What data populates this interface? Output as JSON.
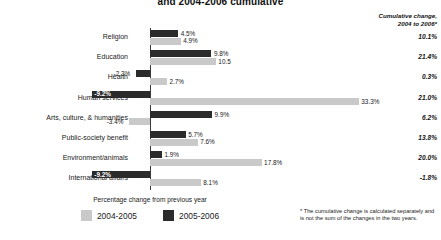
{
  "chart_data": {
    "type": "bar",
    "title": "and 2004-2006 cumulative",
    "orientation": "horizontal",
    "xlabel": "Percentage change from previous year",
    "ylabel": "",
    "grid": false,
    "zero_line": true,
    "xlim": [
      -12,
      36
    ],
    "legend_position": "bottom-center",
    "categories": [
      "Religion",
      "Education",
      "Health",
      "Human services",
      "Arts, culture, & humanities",
      "Public-society benefit",
      "Environment/animals",
      "International affairs"
    ],
    "series": [
      {
        "name": "2005-2006",
        "color": "#2b2b2b",
        "values": [
          4.5,
          9.8,
          -2.3,
          -9.2,
          9.9,
          5.7,
          1.9,
          -9.2
        ],
        "labels": [
          "4.5%",
          "9.8%",
          "-2.3%",
          "-9.2%",
          "9.9%",
          "5.7%",
          "1.9%",
          "-9.2%"
        ]
      },
      {
        "name": "2004-2005",
        "color": "#c9c9c9",
        "values": [
          4.9,
          10.5,
          2.7,
          33.3,
          -3.4,
          7.6,
          17.8,
          8.1
        ],
        "labels": [
          "4.9%",
          "10.5",
          "2.7%",
          "33.3%",
          "-3.4%",
          "7.6%",
          "17.8%",
          "8.1%"
        ]
      }
    ],
    "cumulative_header": "Cumulative change,\n2004 to 2006*",
    "cumulative_header_line1": "Cumulative change,",
    "cumulative_header_line2": "2004 to 2006*",
    "cumulative_values": [
      "10.1%",
      "21.4%",
      "0.3%",
      "21.0%",
      "6.2%",
      "13.8%",
      "20.0%",
      "-1.8%"
    ],
    "annotations": [
      "* The cumulative change is calculated separately and is not the sum of the changes in the two years."
    ]
  },
  "legend": {
    "caption": "Percentage change from previous year",
    "items": [
      {
        "label": "2004-2005",
        "color": "#c9c9c9"
      },
      {
        "label": "2005-2006",
        "color": "#2b2b2b"
      }
    ]
  },
  "footnote": {
    "line1": "* The cumulative change is calculated",
    "line2": "separately and is not the sum of the",
    "line3": "changes in the two years."
  }
}
